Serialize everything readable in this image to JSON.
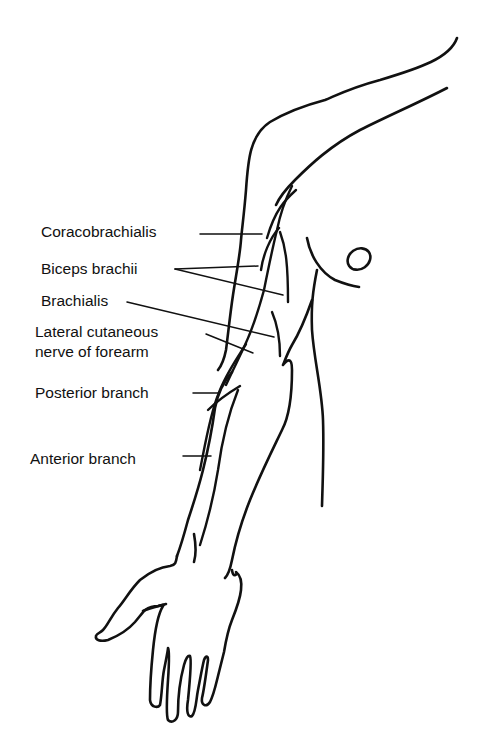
{
  "figure": {
    "labels": [
      {
        "id": "coracobrachialis",
        "text": "Coracobrachialis",
        "x": 41,
        "y": 222
      },
      {
        "id": "biceps-brachii",
        "text": "Biceps brachii",
        "x": 41,
        "y": 259
      },
      {
        "id": "brachialis",
        "text": "Brachialis",
        "x": 41,
        "y": 291
      },
      {
        "id": "lateral-cutaneous-1",
        "text": "Lateral cutaneous",
        "x": 35,
        "y": 322
      },
      {
        "id": "lateral-cutaneous-2",
        "text": "nerve of forearm",
        "x": 35,
        "y": 342
      },
      {
        "id": "posterior-branch",
        "text": "Posterior branch",
        "x": 35,
        "y": 383
      },
      {
        "id": "anterior-branch",
        "text": "Anterior branch",
        "x": 30,
        "y": 449
      }
    ],
    "colors": {
      "ink": "#111111",
      "background": "#ffffff"
    }
  }
}
